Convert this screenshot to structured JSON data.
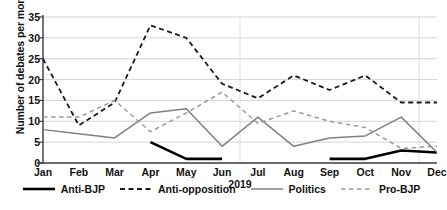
{
  "chart_data": {
    "type": "line",
    "title": "",
    "xlabel": "2019",
    "ylabel": "Number of debates per month",
    "categories": [
      "Jan",
      "Feb",
      "Mar",
      "Apr",
      "May",
      "Jun",
      "Jul",
      "Aug",
      "Sep",
      "Oct",
      "Nov",
      "Dec"
    ],
    "ylim": [
      0,
      35
    ],
    "yticks": [
      0,
      5,
      10,
      15,
      20,
      25,
      30,
      35
    ],
    "grid": "horizontal",
    "legend_position": "bottom",
    "series": [
      {
        "name": "Anti-BJP",
        "style": "solid",
        "color": "#000000",
        "width": 2.6,
        "values": [
          null,
          null,
          null,
          5,
          1,
          1,
          null,
          null,
          1,
          1,
          3,
          2.5
        ]
      },
      {
        "name": "Anti-opposition",
        "style": "dashed",
        "color": "#1a1a1a",
        "width": 1.8,
        "values": [
          25,
          9,
          14.5,
          33,
          30,
          19,
          15.5,
          21,
          17.5,
          21,
          14.5,
          14.5
        ]
      },
      {
        "name": "Politics",
        "style": "solid",
        "color": "#808080",
        "width": 1.5,
        "values": [
          8,
          7,
          6,
          12,
          13,
          4,
          11,
          4,
          6,
          6.5,
          11,
          2.5
        ]
      },
      {
        "name": "Pro-BJP",
        "style": "dashed",
        "color": "#9a9a9a",
        "width": 1.5,
        "values": [
          11,
          11,
          15,
          7.5,
          12,
          17,
          9.5,
          12.5,
          10,
          8.5,
          3.5,
          4
        ]
      }
    ]
  },
  "colors": {
    "gridline": "#d4d4d4",
    "axis": "#3a3a3a",
    "background": "#ffffff"
  }
}
